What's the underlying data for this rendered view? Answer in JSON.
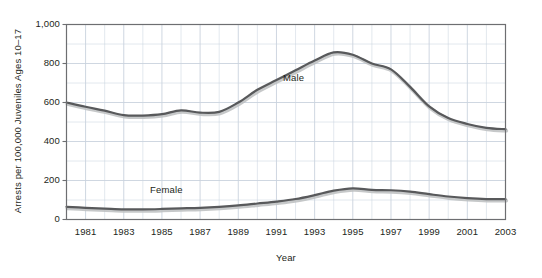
{
  "chart_data": {
    "type": "line",
    "title": "",
    "xlabel": "Year",
    "ylabel": "Arrests per 100,000 Juveniles Ages 10–17",
    "xlim": [
      1980,
      2003
    ],
    "ylim": [
      0,
      1000
    ],
    "grid": true,
    "legend_position": "inline-annotations",
    "y_ticks": [
      0,
      200,
      400,
      600,
      800,
      1000
    ],
    "y_tick_labels": [
      "0",
      "200",
      "400",
      "600",
      "800",
      "1,000"
    ],
    "y_minor_ticks": [
      100,
      300,
      500,
      700,
      900
    ],
    "x_ticks": [
      1981,
      1983,
      1985,
      1987,
      1989,
      1991,
      1993,
      1995,
      1997,
      1999,
      2001,
      2003
    ],
    "x_tick_labels": [
      "1981",
      "1983",
      "1985",
      "1987",
      "1989",
      "1991",
      "1993",
      "1995",
      "1997",
      "1999",
      "2001",
      "2003"
    ],
    "x_minor_ticks": [
      1980,
      1982,
      1984,
      1986,
      1988,
      1990,
      1992,
      1994,
      1996,
      1998,
      2000,
      2002
    ],
    "x": [
      1980,
      1981,
      1982,
      1983,
      1984,
      1985,
      1986,
      1987,
      1988,
      1989,
      1990,
      1991,
      1992,
      1993,
      1994,
      1995,
      1996,
      1997,
      1998,
      1999,
      2000,
      2001,
      2002,
      2003
    ],
    "series": [
      {
        "name": "Male",
        "color": "#58595b",
        "values": [
          600,
          578,
          558,
          535,
          533,
          540,
          560,
          548,
          552,
          600,
          665,
          715,
          765,
          815,
          857,
          845,
          800,
          770,
          680,
          580,
          520,
          490,
          470,
          463
        ]
      },
      {
        "name": "Female",
        "color": "#58595b",
        "values": [
          65,
          60,
          56,
          52,
          52,
          54,
          57,
          60,
          65,
          72,
          82,
          92,
          105,
          125,
          148,
          160,
          152,
          150,
          143,
          130,
          118,
          110,
          105,
          104
        ]
      }
    ],
    "annotations": [
      {
        "text": "Male",
        "x": 1992.3,
        "y": 700
      },
      {
        "text": "Female",
        "x": 1984.8,
        "y": 215
      }
    ]
  },
  "style": {
    "grid_color": "#c9d3de",
    "frame_color": "#6d6e71",
    "line_color": "#58595b",
    "shadow_color": "#bcbec0",
    "text_color": "#231f20",
    "background": "#ffffff"
  }
}
